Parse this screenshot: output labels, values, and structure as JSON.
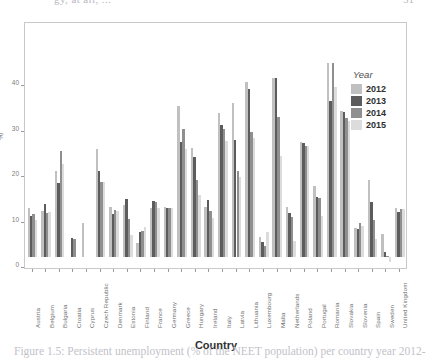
{
  "page": {
    "header_left_bleed": "gy, at all, ...",
    "header_right_bleed": "51",
    "caption_bleed": "Figure 1.5: Persistent unemployment (% of the NEET population) per country year 2012-"
  },
  "legend": {
    "title": "Year",
    "entries": [
      {
        "label": "2012",
        "color": "#c0c0c0"
      },
      {
        "label": "2013",
        "color": "#5c5c5c"
      },
      {
        "label": "2014",
        "color": "#8f8f8f"
      },
      {
        "label": "2015",
        "color": "#dcdcdc"
      }
    ]
  },
  "axes": {
    "y_label": "%",
    "x_label": "Country",
    "y_ticks": [
      "0",
      "10",
      "20",
      "30",
      "40"
    ]
  },
  "chart_data": {
    "type": "bar",
    "title": "",
    "subtitle": "",
    "xlabel": "Country",
    "ylabel": "%",
    "ylim": [
      0,
      44
    ],
    "yticks": [
      0,
      10,
      20,
      30,
      40
    ],
    "grid": false,
    "legend_position": "right-inside",
    "legend_title": "Year",
    "categories": [
      "Austria",
      "Belgium",
      "Bulgaria",
      "Croatia",
      "Cyprus",
      "Czech Republic",
      "Denmark",
      "Estonia",
      "Finland",
      "France",
      "Germany",
      "Greece",
      "Hungary",
      "Ireland",
      "Italy",
      "Latvia",
      "Lithuania",
      "Luxembourg",
      "Malta",
      "Netherlands",
      "Poland",
      "Portugal",
      "Romania",
      "Slovakia",
      "Slovenia",
      "Spain",
      "Sweden",
      "United Kingdom"
    ],
    "series": [
      {
        "name": "2012",
        "color": "#c0c0c0",
        "values": [
          10.8,
          10.2,
          19.0,
          null,
          7.5,
          23.8,
          11.0,
          11.4,
          3.0,
          10.8,
          10.9,
          33.3,
          24.0,
          10.9,
          31.6,
          33.8,
          38.4,
          4.5,
          39.3,
          11.0,
          25.2,
          15.5,
          42.6,
          32.0,
          6.4,
          17.0,
          5.0,
          10.8
        ]
      },
      {
        "name": "2013",
        "color": "#5c5c5c",
        "values": [
          9.0,
          11.7,
          16.2,
          4.1,
          null,
          19.0,
          9.5,
          12.8,
          5.4,
          12.4,
          10.8,
          25.2,
          22.0,
          12.6,
          29.0,
          25.7,
          37.0,
          3.2,
          39.3,
          9.6,
          25.0,
          13.2,
          34.3,
          31.8,
          6.2,
          12.1,
          1.1,
          10.0
        ]
      },
      {
        "name": "2014",
        "color": "#8f8f8f",
        "values": [
          9.5,
          9.7,
          23.4,
          4.0,
          null,
          16.5,
          10.4,
          8.4,
          5.8,
          12.2,
          10.8,
          28.1,
          17.0,
          10.2,
          28.2,
          19.0,
          27.4,
          2.4,
          30.8,
          8.9,
          24.4,
          13.0,
          42.7,
          30.5,
          7.4,
          8.2,
          0.3,
          10.6
        ]
      },
      {
        "name": "2015",
        "color": "#dcdcdc",
        "values": [
          8.2,
          10.0,
          20.4,
          null,
          null,
          16.4,
          10.2,
          4.8,
          6.5,
          10.8,
          10.7,
          23.8,
          13.6,
          8.5,
          25.5,
          17.6,
          26.2,
          5.5,
          22.1,
          3.5,
          24.3,
          9.0,
          37.3,
          29.9,
          6.8,
          4.0,
          -1.2,
          10.6
        ]
      }
    ]
  }
}
